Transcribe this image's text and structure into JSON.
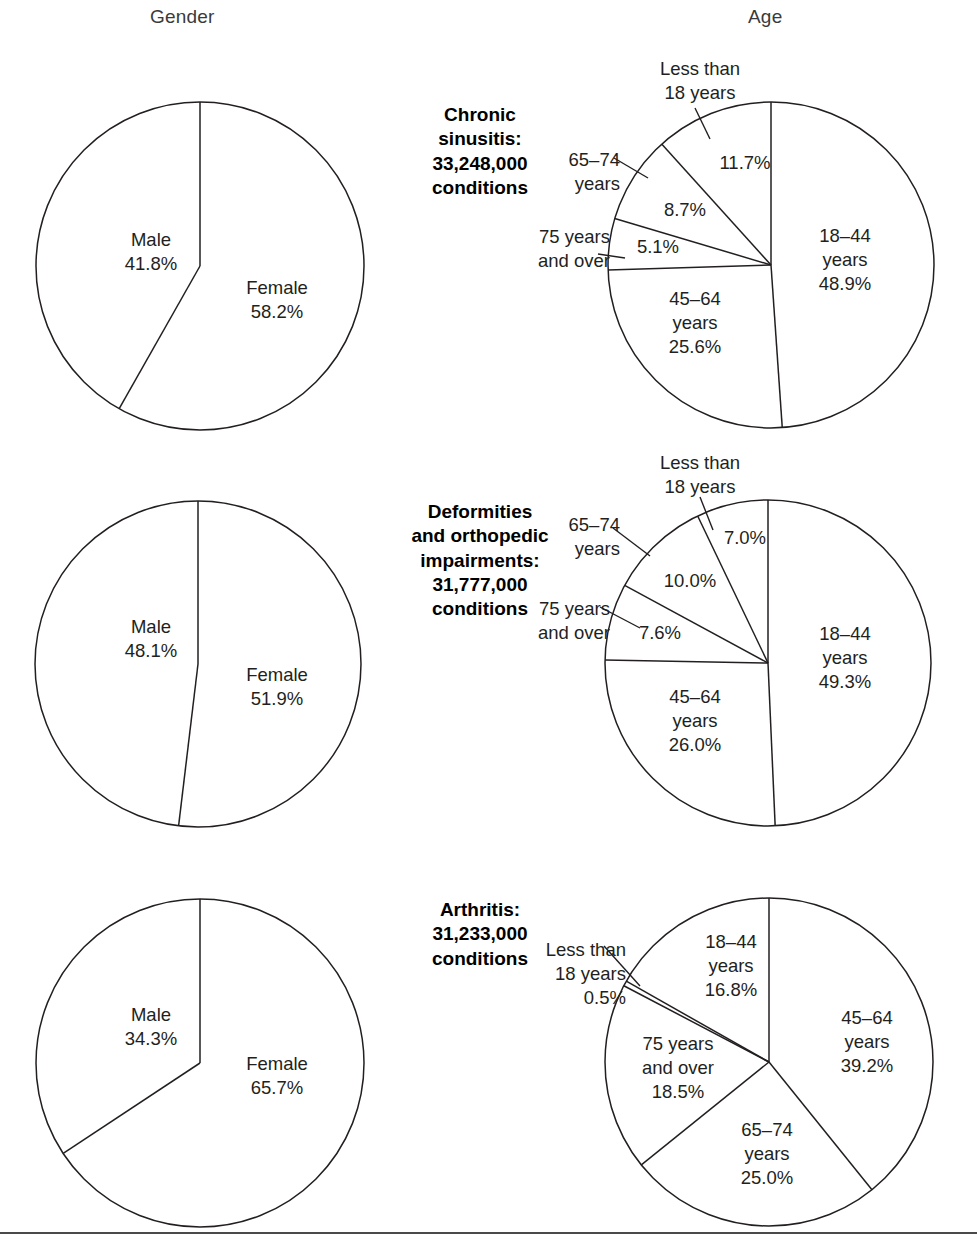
{
  "headers": {
    "gender": "Gender",
    "age": "Age"
  },
  "rows": [
    {
      "title": "Chronic\nsinusitis:\n33,248,000\nconditions",
      "gender": {
        "male_label": "Male",
        "male_value": "41.8%",
        "female_label": "Female",
        "female_value": "58.2%"
      },
      "age": {
        "lt18_label": "Less than\n18 years",
        "lt18_value": "11.7%",
        "a1844_label": "18–44\nyears\n48.9%",
        "a4564_label": "45–64\nyears\n25.6%",
        "a6574_label": "65–74\nyears",
        "a6574_value": "8.7%",
        "a75_label": "75 years\nand over",
        "a75_value": "5.1%"
      }
    },
    {
      "title": "Deformities\nand orthopedic\nimpairments:\n31,777,000\nconditions",
      "gender": {
        "male_label": "Male",
        "male_value": "48.1%",
        "female_label": "Female",
        "female_value": "51.9%"
      },
      "age": {
        "lt18_label": "Less than\n18 years",
        "lt18_value": "7.0%",
        "a1844_label": "18–44\nyears\n49.3%",
        "a4564_label": "45–64\nyears\n26.0%",
        "a6574_label": "65–74\nyears",
        "a6574_value": "10.0%",
        "a75_label": "75 years\nand over",
        "a75_value": "7.6%"
      }
    },
    {
      "title": "Arthritis:\n31,233,000\nconditions",
      "gender": {
        "male_label": "Male",
        "male_value": "34.3%",
        "female_label": "Female",
        "female_value": "65.7%"
      },
      "age": {
        "lt18_label": "Less than\n18 years\n0.5%",
        "a1844_label": "18–44\nyears\n16.8%",
        "a4564_label": "45–64\nyears\n39.2%",
        "a6574_label": "65–74\nyears\n25.0%",
        "a75_label": "75 years\nand over\n18.5%"
      }
    }
  ],
  "chart_data": [
    {
      "type": "pie",
      "title": "Chronic sinusitis: 33,248,000 conditions — Gender",
      "labels": [
        "Female",
        "Male"
      ],
      "values": [
        58.2,
        41.8
      ],
      "unit": "percent",
      "start_angle_deg": 0,
      "direction": "clockwise"
    },
    {
      "type": "pie",
      "title": "Chronic sinusitis: 33,248,000 conditions — Age",
      "labels": [
        "18–44 years",
        "45–64 years",
        "75 years and over",
        "65–74 years",
        "Less than 18 years"
      ],
      "values": [
        48.9,
        25.6,
        5.1,
        8.7,
        11.7
      ],
      "unit": "percent",
      "start_angle_deg": 0,
      "direction": "clockwise"
    },
    {
      "type": "pie",
      "title": "Deformities and orthopedic impairments: 31,777,000 conditions — Gender",
      "labels": [
        "Female",
        "Male"
      ],
      "values": [
        51.9,
        48.1
      ],
      "unit": "percent",
      "start_angle_deg": 0,
      "direction": "clockwise"
    },
    {
      "type": "pie",
      "title": "Deformities and orthopedic impairments: 31,777,000 conditions — Age",
      "labels": [
        "18–44 years",
        "45–64 years",
        "75 years and over",
        "65–74 years",
        "Less than 18 years"
      ],
      "values": [
        49.3,
        26.0,
        7.6,
        10.0,
        7.0
      ],
      "unit": "percent",
      "start_angle_deg": 0,
      "direction": "clockwise"
    },
    {
      "type": "pie",
      "title": "Arthritis: 31,233,000 conditions — Gender",
      "labels": [
        "Female",
        "Male"
      ],
      "values": [
        65.7,
        34.3
      ],
      "unit": "percent",
      "start_angle_deg": 0,
      "direction": "clockwise"
    },
    {
      "type": "pie",
      "title": "Arthritis: 31,233,000 conditions — Age",
      "labels": [
        "45–64 years",
        "65–74 years",
        "75 years and over",
        "Less than 18 years",
        "18–44 years"
      ],
      "values": [
        39.2,
        25.0,
        18.5,
        0.5,
        16.8
      ],
      "unit": "percent",
      "start_angle_deg": 0,
      "direction": "clockwise"
    }
  ]
}
